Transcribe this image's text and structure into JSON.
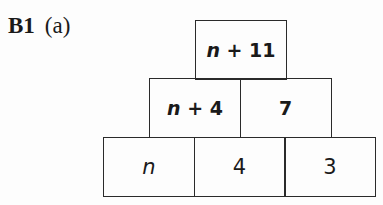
{
  "question": {
    "number": "B1",
    "part": "(a)"
  },
  "pyramid": {
    "top": [
      {
        "var": "n",
        "rest": " + 11"
      }
    ],
    "middle": [
      {
        "var": "n",
        "rest": " + 4"
      },
      {
        "var": "",
        "rest": "7"
      }
    ],
    "bottom": [
      {
        "var": "n",
        "rest": ""
      },
      {
        "var": "",
        "rest": "4"
      },
      {
        "var": "",
        "rest": "3"
      }
    ]
  }
}
